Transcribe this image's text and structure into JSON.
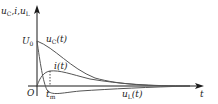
{
  "figure": {
    "type": "circuit-transient-waveforms",
    "colors": {
      "axis": "#1a1a1a",
      "curve": "#555555",
      "background": "#ffffff"
    }
  },
  "axes": {
    "y_label": "u_C, i, u_L",
    "y_label_parts": {
      "u": "u",
      "C": "C",
      "i": "i",
      "uL": "u",
      "L": "L"
    },
    "x_label": "t",
    "origin_label": "O",
    "y_tick_label": "U0",
    "y_tick_parts": {
      "U": "U",
      "sub": "0"
    },
    "x_tick_label": "tm",
    "x_tick_parts": {
      "t": "t",
      "sub": "m"
    }
  },
  "curves": [
    {
      "name": "uC",
      "label": "uC(t)",
      "parts": {
        "u": "u",
        "sub": "C",
        "arg": "(t)"
      },
      "description": "starts at U0 and decays monotonically to 0"
    },
    {
      "name": "i",
      "label": "i(t)",
      "parts": {
        "i": "i",
        "arg": "(t)"
      },
      "description": "rises from 0 to a peak at tm then decays to 0"
    },
    {
      "name": "uL",
      "label": "uL(t)",
      "parts": {
        "u": "u",
        "sub": "L",
        "arg": "(t)"
      },
      "description": "starts at U0, drops quickly, goes negative and returns to 0"
    }
  ]
}
